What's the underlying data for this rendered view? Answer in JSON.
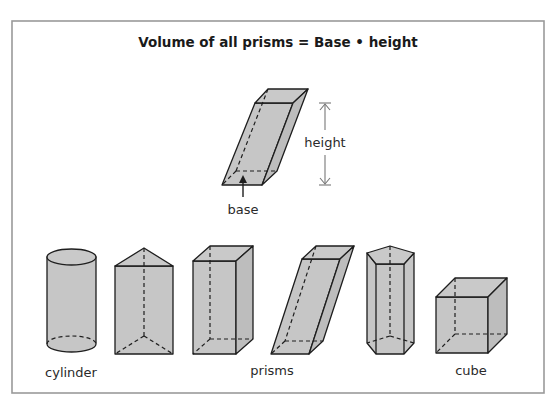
{
  "diagram": {
    "title": "Volume of all prisms = Base • height",
    "main_figure": {
      "shape": "oblique rectangular prism",
      "height_label": "height",
      "base_label": "base"
    },
    "shapes": [
      {
        "name": "cylinder",
        "group": "cylinder"
      },
      {
        "name": "triangular prism",
        "group": "prisms"
      },
      {
        "name": "rectangular prism",
        "group": "prisms"
      },
      {
        "name": "oblique rectangular prism",
        "group": "prisms"
      },
      {
        "name": "pentagonal prism",
        "group": "prisms"
      },
      {
        "name": "cube",
        "group": "cube"
      }
    ],
    "group_labels": {
      "cylinder": "cylinder",
      "prisms": "prisms",
      "cube": "cube"
    },
    "colors": {
      "shape_fill": "#c6c6c6",
      "outline": "#1e1e1e",
      "frame_border": "#9a9a9a",
      "dimension_line": "#777777"
    }
  }
}
